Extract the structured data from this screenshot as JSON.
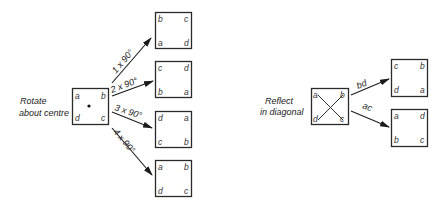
{
  "rotate": {
    "caption_line1": "Rotate",
    "caption_line2": "about centre",
    "source": {
      "tl": "a",
      "tr": "b",
      "bl": "d",
      "br": "c"
    },
    "arrows": [
      {
        "label": "1 x 90°"
      },
      {
        "label": "2 x 90°"
      },
      {
        "label": "3 x 90°"
      },
      {
        "label": "4 x 90°"
      }
    ],
    "results": [
      {
        "tl": "b",
        "tr": "c",
        "bl": "a",
        "br": "d"
      },
      {
        "tl": "c",
        "tr": "d",
        "bl": "b",
        "br": "a"
      },
      {
        "tl": "d",
        "tr": "a",
        "bl": "c",
        "br": "b"
      },
      {
        "tl": "a",
        "tr": "b",
        "bl": "d",
        "br": "c"
      }
    ]
  },
  "reflect": {
    "caption_line1": "Reflect",
    "caption_line2": "in diagonal",
    "source": {
      "tl": "a",
      "tr": "b",
      "bl": "d",
      "br": "c"
    },
    "arrows": [
      {
        "label": "bd"
      },
      {
        "label": "ac"
      }
    ],
    "results": [
      {
        "tl": "c",
        "tr": "b",
        "bl": "d",
        "br": "a"
      },
      {
        "tl": "a",
        "tr": "d",
        "bl": "b",
        "br": "c"
      }
    ]
  }
}
